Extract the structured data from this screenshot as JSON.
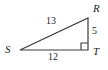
{
  "figure": {
    "kind": "right-triangle-diagram",
    "background_color": "#ffffff",
    "stroke_color": "#3b3b3b",
    "text_color": "#221f1f",
    "vertices": {
      "s": {
        "label": "S",
        "x": 20,
        "y": 50
      },
      "r": {
        "label": "R",
        "x": 88,
        "y": 18
      },
      "t": {
        "label": "T",
        "x": 88,
        "y": 50
      }
    },
    "sides": {
      "hypotenuse": {
        "name": "SR",
        "label": "13"
      },
      "vertical_leg": {
        "name": "RT",
        "label": "5"
      },
      "base_leg": {
        "name": "ST",
        "label": "12"
      }
    },
    "right_angle": {
      "at_vertex": "T",
      "marker": "right-angle-square",
      "size": 7
    }
  },
  "chart_data": {
    "type": "diagram",
    "title": "",
    "subtitle": "",
    "shape": "right triangle",
    "vertex_labels": [
      "S",
      "R",
      "T"
    ],
    "side_lengths": [
      {
        "side": "SR",
        "value": 13,
        "role": "hypotenuse"
      },
      {
        "side": "RT",
        "value": 5,
        "role": "leg"
      },
      {
        "side": "ST",
        "value": 12,
        "role": "leg"
      }
    ],
    "annotations": [
      "right angle at T"
    ],
    "xlabel": "",
    "ylabel": "",
    "grid": false,
    "legend": "none"
  }
}
